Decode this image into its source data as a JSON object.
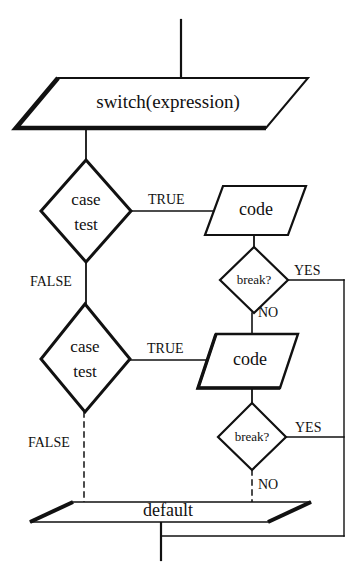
{
  "diagram": {
    "background_color": "#ffffff",
    "line_color": "#111111",
    "text_color": "#111111",
    "fill_color": "#ffffff"
  },
  "nodes": {
    "switch": {
      "label": "switch(expression)",
      "shape": "parallelogram"
    },
    "case_test_1": {
      "label_line1": "case",
      "label_line2": "test",
      "shape": "diamond"
    },
    "code_1": {
      "label": "code",
      "shape": "parallelogram"
    },
    "break_1": {
      "label": "break?",
      "shape": "diamond"
    },
    "case_test_2": {
      "label_line1": "case",
      "label_line2": "test",
      "shape": "diamond"
    },
    "code_2": {
      "label": "code",
      "shape": "parallelogram"
    },
    "break_2": {
      "label": "break?",
      "shape": "diamond"
    },
    "default": {
      "label": "default",
      "shape": "parallelogram"
    }
  },
  "edge_labels": {
    "true_1": "TRUE",
    "false_1": "FALSE",
    "yes_1": "YES",
    "no_1": "NO",
    "true_2": "TRUE",
    "false_2": "FALSE",
    "yes_2": "YES",
    "no_2": "NO"
  }
}
